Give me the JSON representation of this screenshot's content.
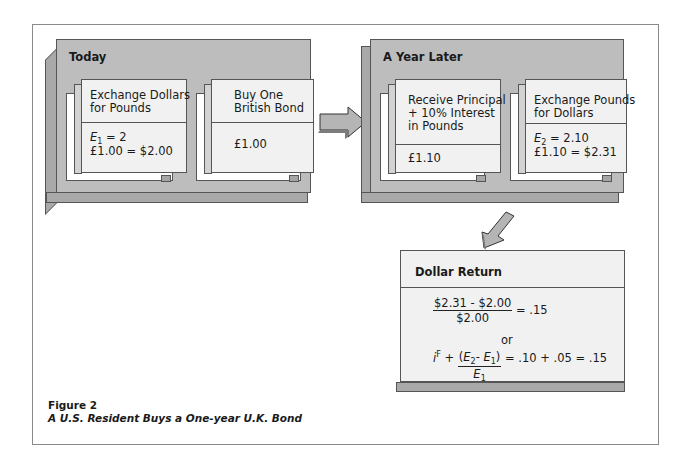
{
  "figure": {
    "label": "Figure 2",
    "title": "A U.S. Resident Buys a One-year U.K. Bond"
  },
  "today": {
    "title": "Today",
    "cards": [
      {
        "heading_line1": "Exchange  Dollars",
        "heading_line2": "for Pounds",
        "body_line1_var": "E",
        "body_line1_sub": "1",
        "body_line1_rest": " = 2",
        "body_line2": "£1.00 = $2.00"
      },
      {
        "heading_line1": "Buy One",
        "heading_line2": "British Bond",
        "body_line2": "£1.00"
      }
    ]
  },
  "year_later": {
    "title": "A Year Later",
    "cards": [
      {
        "heading_line1": "Receive Principal",
        "heading_line2": "+ 10% Interest",
        "heading_line3": "in Pounds",
        "body_line2": "£1.10"
      },
      {
        "heading_line1": "Exchange Pounds",
        "heading_line2": "for Dollars",
        "body_line1_var": "E",
        "body_line1_sub": "2",
        "body_line1_rest": " = 2.10",
        "body_line2": "£1.10 = $2.31"
      }
    ]
  },
  "dollar_return": {
    "title": "Dollar Return",
    "eq1_numerator": "$2.31 - $2.00",
    "eq1_denominator": "$2.00",
    "eq1_result": "= .15",
    "or": "or",
    "eq2_i": "i",
    "eq2_sup": "F",
    "eq2_plus": " + ",
    "eq2_num_open": "(",
    "eq2_E": "E",
    "eq2_sub2": "2",
    "eq2_minus": "- ",
    "eq2_sub1": "1",
    "eq2_num_close": ")",
    "eq2_den_sub": "1",
    "eq2_result": "= .10 + .05 = .15"
  },
  "colors": {
    "panel": "#bdbdbd",
    "card": "#f1f1f1",
    "border": "#555555",
    "frame": "#8a8a8a"
  }
}
